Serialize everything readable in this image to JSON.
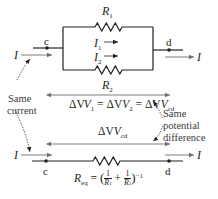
{
  "diagram": {
    "colors": {
      "wire": "#231f20",
      "arrow": "#6d6e71",
      "text": "#231f20",
      "background": "#ffffff"
    },
    "top_circuit": {
      "node_left": "c",
      "node_right": "d",
      "current_in": "I",
      "current_out": "I",
      "resistor_top": {
        "symbol": "R",
        "sub": "1"
      },
      "resistor_bottom": {
        "symbol": "R",
        "sub": "2"
      },
      "branch_current_1": {
        "symbol": "I",
        "sub": "1"
      },
      "branch_current_2": {
        "symbol": "I",
        "sub": "2"
      }
    },
    "equation": {
      "dv": "ΔV",
      "v1_sub": "1",
      "eq": "=",
      "v2_sub": "2",
      "vcd_sub": "cd"
    },
    "annotations": {
      "same_current_line1": "Same",
      "same_current_line2": "current",
      "same_pd_line1": "Same",
      "same_pd_line2": "potential",
      "same_pd_line3": "difference"
    },
    "bottom_circuit": {
      "node_left": "c",
      "node_right": "d",
      "current_in": "I",
      "current_out": "I",
      "dv_label": "ΔV",
      "dv_sub": "cd",
      "req": {
        "symbol": "R",
        "sub": "eq",
        "equals": "=",
        "one": "1",
        "r1": "R",
        "r1_sub": "1",
        "plus": "+",
        "r2": "R",
        "r2_sub": "2",
        "exponent": "−1"
      }
    }
  }
}
